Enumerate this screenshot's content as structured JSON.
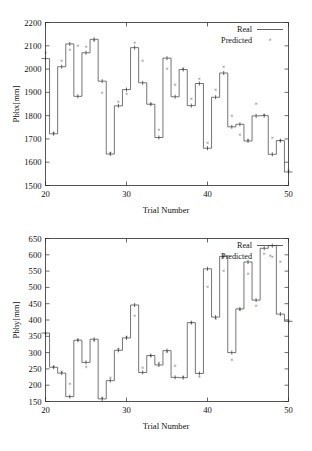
{
  "chart_data": [
    {
      "type": "line",
      "id": "pbhx",
      "title": "",
      "xlabel": "Trial Number",
      "ylabel": "Pbhx[mm]",
      "xlim": [
        20,
        50
      ],
      "ylim": [
        1500,
        2200
      ],
      "xticks": [
        20,
        30,
        40,
        50
      ],
      "yticks": [
        1500,
        1600,
        1700,
        1800,
        1900,
        2000,
        2100,
        2200
      ],
      "grid": false,
      "legend_position": "top-right",
      "legend": [
        "Real",
        "Predicted"
      ],
      "x": [
        20,
        21,
        22,
        23,
        24,
        25,
        26,
        27,
        28,
        29,
        30,
        31,
        32,
        33,
        34,
        35,
        36,
        37,
        38,
        39,
        40,
        41,
        42,
        43,
        44,
        45,
        46,
        47,
        48,
        49,
        50
      ],
      "series": [
        {
          "name": "Real",
          "style": "step",
          "values": [
            2045,
            1722,
            2010,
            2108,
            1883,
            2070,
            2128,
            1948,
            1635,
            1842,
            1912,
            2092,
            1941,
            1849,
            1706,
            2047,
            1881,
            1998,
            1843,
            1938,
            1660,
            1879,
            1983,
            1752,
            1763,
            1691,
            1799,
            1800,
            1634,
            1693,
            1558
          ]
        },
        {
          "name": "Predicted",
          "style": "markers",
          "values": [
            2068,
            1724,
            2035,
            2083,
            2100,
            2095,
            2122,
            1896,
            1638,
            1857,
            1893,
            2113,
            2035,
            1851,
            1740,
            1999,
            1932,
            2000,
            1872,
            1959,
            1683,
            1912,
            2007,
            1798,
            1716,
            1695,
            1848,
            1802,
            1705,
            1692,
            1562
          ]
        }
      ]
    },
    {
      "type": "line",
      "id": "pbhy",
      "title": "",
      "xlabel": "Trial Number",
      "ylabel": "Pbhy[mm]",
      "xlim": [
        20,
        50
      ],
      "ylim": [
        150,
        650
      ],
      "xticks": [
        20,
        30,
        40,
        50
      ],
      "yticks": [
        150,
        200,
        250,
        300,
        350,
        400,
        450,
        500,
        550,
        600,
        650
      ],
      "grid": false,
      "legend_position": "top-right",
      "legend": [
        "Real",
        "Predicted"
      ],
      "x": [
        20,
        21,
        22,
        23,
        24,
        25,
        26,
        27,
        28,
        29,
        30,
        31,
        32,
        33,
        34,
        35,
        36,
        37,
        38,
        39,
        40,
        41,
        42,
        43,
        44,
        45,
        46,
        47,
        48,
        49,
        50
      ],
      "series": [
        {
          "name": "Real",
          "style": "step",
          "values": [
            360,
            255,
            237,
            165,
            338,
            270,
            341,
            158,
            214,
            307,
            345,
            446,
            239,
            291,
            262,
            306,
            224,
            223,
            392,
            236,
            557,
            409,
            595,
            300,
            434,
            578,
            461,
            620,
            628,
            418,
            396
          ]
        },
        {
          "name": "Predicted",
          "style": "markers",
          "values": [
            358,
            256,
            240,
            205,
            339,
            257,
            336,
            160,
            221,
            310,
            347,
            412,
            253,
            289,
            267,
            303,
            259,
            224,
            390,
            225,
            502,
            404,
            549,
            276,
            430,
            541,
            443,
            601,
            593,
            578,
            397
          ]
        }
      ]
    }
  ],
  "figures": {
    "top": {
      "ylabel": "Pbhx[mm]",
      "xlabel": "Trial Number",
      "yticks": [
        "2200",
        "2100",
        "2000",
        "1900",
        "1800",
        "1700",
        "1600",
        "1500"
      ],
      "xticks": [
        "20",
        "30",
        "40",
        "50"
      ],
      "legend": {
        "real": "Real",
        "predicted": "Predicted"
      }
    },
    "bottom": {
      "ylabel": "Pbhy[mm]",
      "xlabel": "Trial Number",
      "yticks": [
        "650",
        "600",
        "550",
        "500",
        "450",
        "400",
        "350",
        "300",
        "250",
        "200",
        "150"
      ],
      "xticks": [
        "20",
        "30",
        "40",
        "50"
      ],
      "legend": {
        "real": "Real",
        "predicted": "Predicted"
      }
    }
  },
  "markers": {
    "predicted_glyph": "×"
  }
}
